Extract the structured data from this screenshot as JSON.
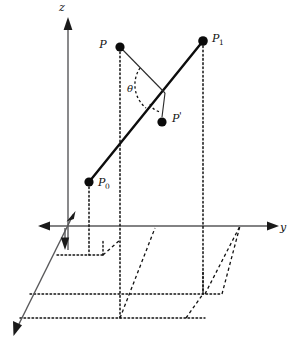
{
  "figure": {
    "type": "geometry-diagram",
    "background_color": "#ffffff",
    "ink_color": "#111111",
    "axis_color": "#58585a"
  },
  "axes": {
    "z": {
      "label": "z",
      "direction": "up",
      "label_x": 62,
      "label_y": 11
    },
    "y": {
      "label": "y",
      "direction": "right",
      "label_x": 283,
      "label_y": 231
    },
    "x": {
      "label": "",
      "direction": "down-left"
    },
    "origin": {
      "x": 68,
      "y": 226
    }
  },
  "points": [
    {
      "id": "P",
      "label": "P",
      "sub": "",
      "x": 120,
      "y": 47,
      "label_x": 103,
      "label_y": 48
    },
    {
      "id": "P1",
      "label": "P",
      "sub": "1",
      "x": 203,
      "y": 41,
      "label_x": 212,
      "label_y": 42
    },
    {
      "id": "P0",
      "label": "P",
      "sub": "0",
      "x": 89,
      "y": 182,
      "label_x": 98,
      "label_y": 186
    },
    {
      "id": "Pp",
      "label": "P",
      "sub": "",
      "prime": "'",
      "x": 162,
      "y": 122,
      "label_x": 172,
      "label_y": 122
    }
  ],
  "angle": {
    "label": "θ",
    "label_x": 130,
    "label_y": 92,
    "vertex_x": 162,
    "vertex_y": 95
  },
  "segments": [
    {
      "name": "ray-P0-P1",
      "from": "P0",
      "to": "P1",
      "style": "thick-solid"
    },
    {
      "name": "chord-P-to-foot",
      "from": "P",
      "to": "foot-on-ray",
      "style": "thin-solid"
    },
    {
      "name": "perp-foot-to-Pprime",
      "from": "foot-on-ray",
      "to": "Pp",
      "style": "thin-solid"
    }
  ],
  "projection_lines": [
    {
      "name": "drop-from-P",
      "style": "dotted"
    },
    {
      "name": "drop-from-P1",
      "style": "dotted"
    },
    {
      "name": "drop-from-P0",
      "style": "dotted"
    }
  ],
  "floor": {
    "description": "xy-plane grid drawn as dotted horizontal lines and dashed slanted lines forming parallelograms",
    "style": "dotted-and-dashed parallelogram grid"
  }
}
